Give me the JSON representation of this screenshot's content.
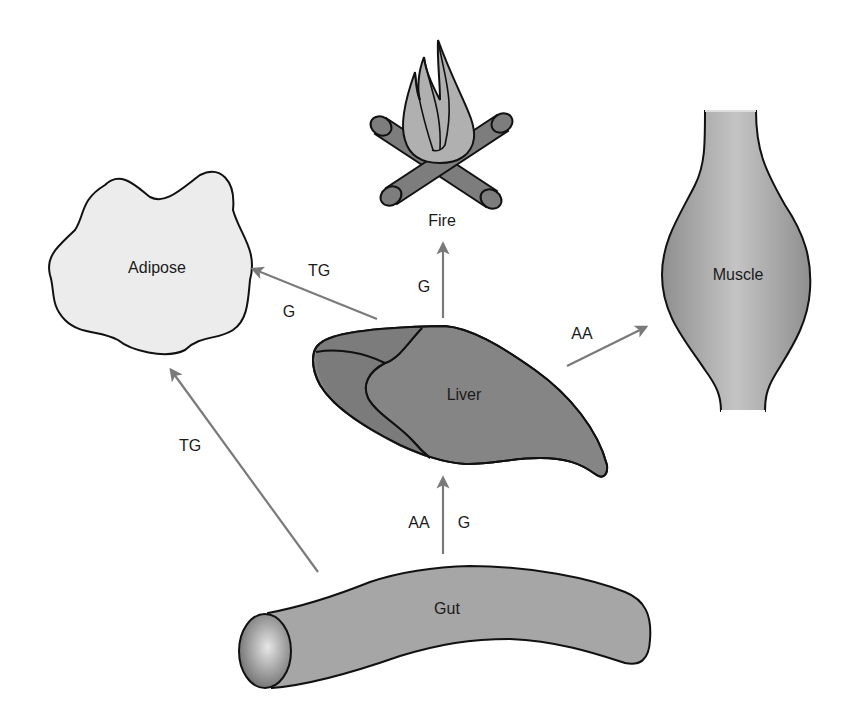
{
  "diagram": {
    "nodes": {
      "fire": {
        "label": "Fire"
      },
      "adipose": {
        "label": "Adipose"
      },
      "muscle": {
        "label": "Muscle"
      },
      "liver": {
        "label": "Liver"
      },
      "gut": {
        "label": "Gut"
      }
    },
    "edges": {
      "liver_to_fire": {
        "from": "Liver",
        "to": "Fire",
        "labels": [
          "G"
        ]
      },
      "liver_to_adipose": {
        "from": "Liver",
        "to": "Adipose",
        "labels": [
          "TG",
          "G"
        ]
      },
      "liver_to_muscle": {
        "from": "Liver",
        "to": "Muscle",
        "labels": [
          "AA"
        ]
      },
      "gut_to_liver": {
        "from": "Gut",
        "to": "Liver",
        "labels": [
          "AA",
          "G"
        ]
      },
      "gut_to_adipose": {
        "from": "Gut",
        "to": "Adipose",
        "labels": [
          "TG"
        ]
      }
    },
    "colors": {
      "arrow": "#7a7a7a",
      "liver": "#858585",
      "adipose": "#ececec",
      "muscle": "#b5b5b5",
      "gut": "#a6a6a6",
      "flame": "#b0b0b0",
      "log": "#7d7d7d"
    }
  }
}
